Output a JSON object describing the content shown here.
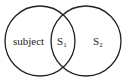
{
  "diagram": {
    "type": "venn",
    "sets": [
      {
        "id": "left",
        "label": "subject"
      },
      {
        "id": "right",
        "label": "S",
        "subscript": "2"
      }
    ],
    "intersection": {
      "label": "S",
      "subscript": "1"
    },
    "colors": {
      "stroke": "#222222",
      "background": "#ffffff"
    }
  }
}
